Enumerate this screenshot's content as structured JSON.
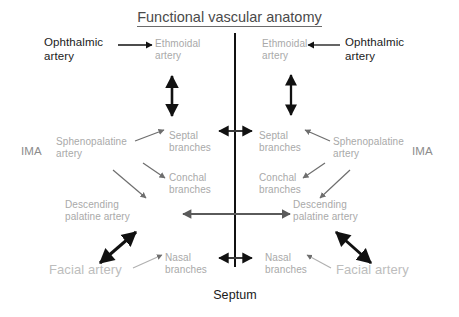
{
  "diagram": {
    "title": "Functional vascular anatomy",
    "septum_label": "Septum",
    "colors": {
      "title": "#4a4a4a",
      "dark_text": "#1a1a1a",
      "gray_text": "#a9a9a9",
      "mid_gray_text": "#8c8c8c",
      "light_gray_text": "#bdbdbd",
      "black_arrow": "#111111",
      "gray_arrow": "#6e6e6e",
      "septum_line": "#111111"
    },
    "left": {
      "ophthalmic_artery": "Ophthalmic\nartery",
      "ethmoidal_artery": "Ethmoidal\nartery",
      "ima": "IMA",
      "sphenopalatine_artery": "Sphenopalatine\nartery",
      "septal_branches": "Septal\nbranches",
      "conchal_branches": "Conchal\nbranches",
      "descending_palatine_artery": "Descending\npalatine artery",
      "facial_artery": "Facial artery",
      "nasal_branches": "Nasal\nbranches"
    },
    "right": {
      "ophthalmic_artery": "Ophthalmic\nartery",
      "ethmoidal_artery": "Ethmoidal\nartery",
      "ima": "IMA",
      "sphenopalatine_artery": "Sphenopalatine\nartery",
      "septal_branches": "Septal\nbranches",
      "conchal_branches": "Conchal\nbranches",
      "descending_palatine_artery": "Descending\npalatine artery",
      "facial_artery": "Facial artery",
      "nasal_branches": "Nasal\nbranches"
    }
  }
}
